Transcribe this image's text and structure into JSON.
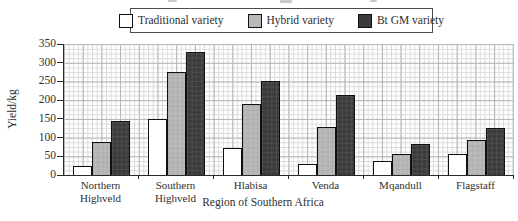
{
  "legend": {
    "border_color": "#4d4d4d"
  },
  "chart_data": {
    "type": "bar",
    "title": "",
    "categories": [
      "Northern Highveld",
      "Southern Highveld",
      "Hlabisa",
      "Venda",
      "Mqandull",
      "Flagstaff"
    ],
    "series": [
      {
        "name": "Traditional variety",
        "color": "#ffffff",
        "values": [
          25,
          150,
          73,
          30,
          38,
          57
        ]
      },
      {
        "name": "Hybrid variety",
        "color": "#b9b9b9",
        "values": [
          88,
          275,
          190,
          128,
          57,
          93
        ]
      },
      {
        "name": "Bt GM variety",
        "color": "#3b3b3b",
        "values": [
          145,
          330,
          250,
          213,
          82,
          125
        ]
      }
    ],
    "xlabel": "Region of Southern Africa",
    "ylabel": "Yield/kg",
    "ylim": [
      0,
      350
    ],
    "ytick_step": 50,
    "yticks": [
      0,
      50,
      100,
      150,
      200,
      250,
      300,
      350
    ],
    "grid": "fine graph paper, on",
    "legend_position": "top"
  }
}
